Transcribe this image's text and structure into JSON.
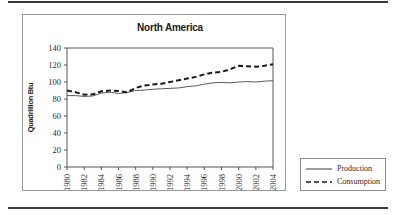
{
  "figure": {
    "background_color": "#ffffff",
    "rule_color": "#3a3a3a",
    "frame_color": "#9a9a9a"
  },
  "chart_data": {
    "type": "line",
    "title": "North America",
    "xlabel": "",
    "ylabel": "Quadrillion Btu",
    "ylim": [
      0,
      140
    ],
    "yticks": [
      0,
      20,
      40,
      60,
      80,
      100,
      120,
      140
    ],
    "ytick_labels": [
      "0",
      "20",
      "40",
      "60",
      "80",
      "100",
      "120",
      "140"
    ],
    "grid": false,
    "legend_position": "outside-right-bottom",
    "x": [
      1980,
      1981,
      1982,
      1983,
      1984,
      1985,
      1986,
      1987,
      1988,
      1989,
      1990,
      1991,
      1992,
      1993,
      1994,
      1995,
      1996,
      1997,
      1998,
      1999,
      2000,
      2001,
      2002,
      2003,
      2004
    ],
    "xtick_labels": [
      "1980",
      "1982",
      "1984",
      "1986",
      "1988",
      "1990",
      "1992",
      "1994",
      "1996",
      "1998",
      "2000",
      "2002",
      "2004"
    ],
    "xticks": [
      1980,
      1982,
      1984,
      1986,
      1988,
      1990,
      1992,
      1994,
      1996,
      1998,
      2000,
      2002,
      2004
    ],
    "series": [
      {
        "name": "Production",
        "style": "solid",
        "color": "#5a5a5a",
        "values": [
          84,
          84,
          83,
          83.5,
          87,
          88,
          86.5,
          87.5,
          90,
          90.5,
          91.5,
          92,
          92.5,
          93,
          94.5,
          95.5,
          97.5,
          99,
          99.5,
          99,
          100,
          100.5,
          100,
          101,
          101.5
        ]
      },
      {
        "name": "Consumption",
        "style": "dashed",
        "color": "#1a1a1a",
        "values": [
          90,
          88,
          85,
          85.5,
          89,
          90,
          89.5,
          88,
          93,
          96,
          97,
          98,
          100,
          102,
          104,
          106,
          109,
          111,
          112,
          115,
          119,
          118.5,
          118,
          119,
          121
        ]
      }
    ]
  },
  "legend": {
    "items": [
      {
        "label": "Production",
        "style": "solid"
      },
      {
        "label": "Consumption",
        "style": "dashed"
      }
    ]
  }
}
